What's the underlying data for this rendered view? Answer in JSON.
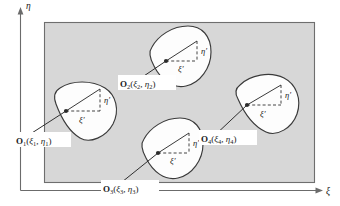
{
  "figure": {
    "background_color": "#ffffff",
    "region_fill_color": "#d7d7d7",
    "region_stroke_color": "#6e6e6e",
    "blob_fill_color": "#fdfdfd",
    "blob_stroke_color": "#3a3a3a"
  },
  "global_axes": {
    "vertical": {
      "label": "η",
      "name": "eta-axis"
    },
    "horizontal": {
      "label": "ξ",
      "name": "xi-axis"
    }
  },
  "local_axes": {
    "horizontal_label": "ξ′",
    "vertical_label": "η′"
  },
  "bodies": [
    {
      "id": "body-1",
      "origin_name": "O",
      "origin_subscript": "1",
      "coord_xi": "ξ",
      "coord_xi_sub": "1",
      "coord_eta": "η",
      "coord_eta_sub": "1",
      "label_full": "O₁(ξ₁, η₁)",
      "local_xi": "ξ′",
      "local_eta": "η′"
    },
    {
      "id": "body-2",
      "origin_name": "O",
      "origin_subscript": "2",
      "coord_xi": "ξ",
      "coord_xi_sub": "2",
      "coord_eta": "η",
      "coord_eta_sub": "2",
      "label_full": "O₂(ξ₂, η₂)",
      "local_xi": "ξ′",
      "local_eta": "η′"
    },
    {
      "id": "body-3",
      "origin_name": "O",
      "origin_subscript": "3",
      "coord_xi": "ξ",
      "coord_xi_sub": "3",
      "coord_eta": "η",
      "coord_eta_sub": "3",
      "label_full": "O₃(ξ₃, η₃)",
      "local_xi": "ξ′",
      "local_eta": "η′"
    },
    {
      "id": "body-4",
      "origin_name": "O",
      "origin_subscript": "4",
      "coord_xi": "ξ",
      "coord_xi_sub": "4",
      "coord_eta": "η",
      "coord_eta_sub": "4",
      "label_full": "O₄(ξ₄, η₄)",
      "local_xi": "ξ′",
      "local_eta": "η′"
    }
  ]
}
